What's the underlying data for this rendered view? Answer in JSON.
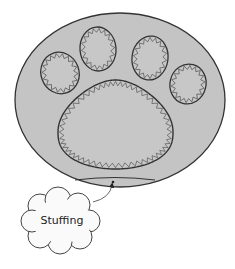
{
  "diagram": {
    "type": "sewing-pattern-illustration",
    "colors": {
      "background": "#ffffff",
      "fabric_fill": "#c4c4c4",
      "pad_fill": "#c7c7c7",
      "outline": "#333333",
      "stitch": "#555555",
      "cloud_fill": "#fafafa",
      "cloud_stroke": "#444444"
    },
    "outer_shape": {
      "cx": 120,
      "cy": 100,
      "rx": 105,
      "ry": 87
    },
    "toe_pads": [
      {
        "name": "toe-pad-1",
        "cx": 60,
        "cy": 73,
        "rx": 19,
        "ry": 21,
        "rotate": -20
      },
      {
        "name": "toe-pad-2",
        "cx": 98,
        "cy": 49,
        "rx": 18,
        "ry": 22,
        "rotate": -5
      },
      {
        "name": "toe-pad-3",
        "cx": 150,
        "cy": 58,
        "rx": 18,
        "ry": 22,
        "rotate": 8
      },
      {
        "name": "toe-pad-4",
        "cx": 188,
        "cy": 84,
        "rx": 18,
        "ry": 20,
        "rotate": 15
      }
    ],
    "main_pad": {
      "top": 80,
      "bottom": 169,
      "left": 58,
      "right": 173
    },
    "stuffing_opening": {
      "x1": 75,
      "x2": 155,
      "y": 180
    },
    "callout": {
      "label": "Stuffing",
      "label_x": 62,
      "label_y": 220,
      "arrow_to": {
        "x": 112,
        "y": 181
      }
    }
  }
}
